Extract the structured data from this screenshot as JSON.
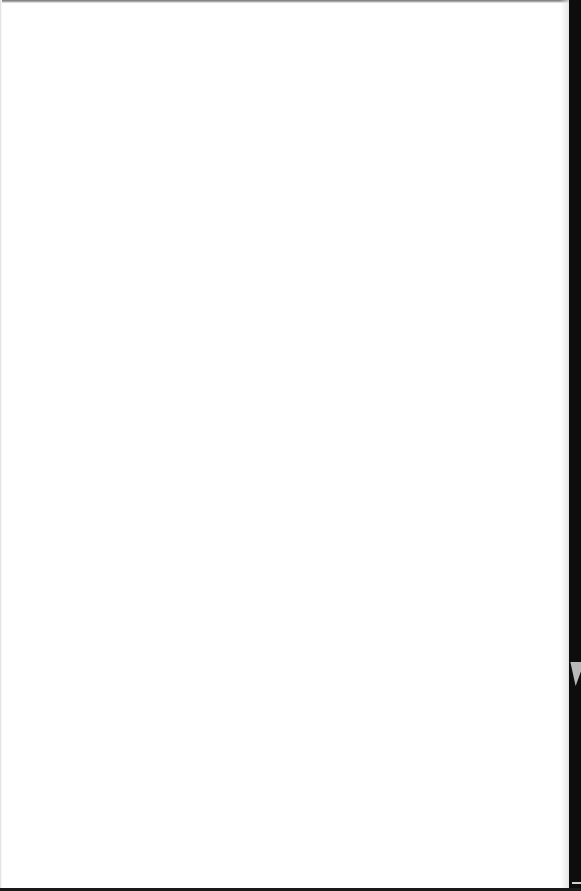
{
  "document": {
    "type": "blank-page",
    "content": "",
    "page_color": "#ffffff",
    "background_color": "#0d0d0d"
  }
}
